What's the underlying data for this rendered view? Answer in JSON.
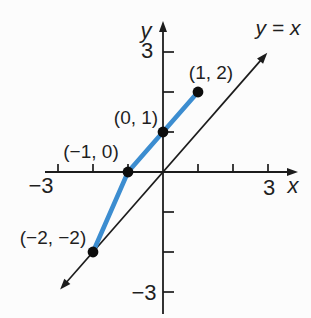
{
  "figure": {
    "background": "#fcfcfc",
    "axis_color": "#1c1c1c",
    "curve_color": "#3c8dd0",
    "point_color": "#0d0d0d",
    "text_color": "#1f1f1f"
  },
  "labels": {
    "y_axis_letter": "y",
    "x_axis_letter": "x",
    "line_equation": "y = x",
    "y_tick_top": "3",
    "y_tick_bottom": "−3",
    "x_tick_left": "−3",
    "x_tick_right": "3",
    "point_1_2": "(1, 2)",
    "point_0_1": "(0, 1)",
    "point_neg1_0": "(−1, 0)",
    "point_neg2_neg2": "(−2, −2)"
  },
  "chart_data": {
    "type": "line",
    "title": "",
    "xlabel": "x",
    "ylabel": "y",
    "xlim": [
      -3.5,
      3.5
    ],
    "ylim": [
      -3.5,
      3.5
    ],
    "grid": false,
    "x_ticks": [
      -3,
      -2,
      -1,
      1,
      2,
      3
    ],
    "y_ticks": [
      -3,
      -2,
      -1,
      1,
      2,
      3
    ],
    "labeled_ticks": {
      "x": [
        -3,
        3
      ],
      "y": [
        -3,
        3
      ]
    },
    "series": [
      {
        "name": "piecewise-function",
        "type": "line",
        "color": "#3c8dd0",
        "marker": "filled-circle",
        "marker_color": "#0d0d0d",
        "points": [
          [
            -2,
            -2
          ],
          [
            -1,
            0
          ],
          [
            0,
            1
          ],
          [
            1,
            2
          ]
        ]
      },
      {
        "name": "y = x",
        "type": "line",
        "color": "#1c1c1c",
        "style": "reference-line-with-arrows",
        "points": [
          [
            -3,
            -3
          ],
          [
            3,
            3
          ]
        ]
      }
    ],
    "annotations": [
      {
        "text": "(1, 2)",
        "at": [
          1,
          2
        ]
      },
      {
        "text": "(0, 1)",
        "at": [
          0,
          1
        ]
      },
      {
        "text": "(−1, 0)",
        "at": [
          -1,
          0
        ]
      },
      {
        "text": "(−2, −2)",
        "at": [
          -2,
          -2
        ]
      },
      {
        "text": "y = x",
        "at": [
          3.2,
          3.2
        ]
      }
    ]
  }
}
